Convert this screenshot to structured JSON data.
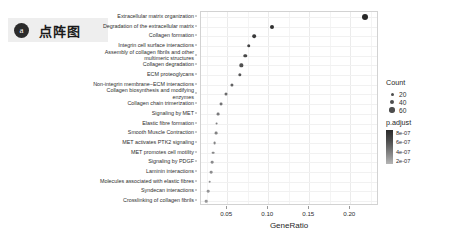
{
  "badge": {
    "letter": "a",
    "title": "点阵图"
  },
  "chart_data": {
    "type": "scatter",
    "title": "",
    "xlabel": "GeneRatio",
    "ylabel": "",
    "xlim": [
      0.018,
      0.235
    ],
    "xticks": [
      0.05,
      0.1,
      0.15,
      0.2
    ],
    "xtick_labels": [
      "0.05",
      "0.10",
      "0.15",
      "0.20"
    ],
    "grid": true,
    "legend_position": "right",
    "categories": [
      "Extracellular matrix organization",
      "Degradation of the extracellular matrix",
      "Collagen formation",
      "Integrin cell surface interactions",
      "Assembly of collagen fibrils and other\nmultimeric structures",
      "Collagen degradation",
      "ECM proteoglycans",
      "Non-integrin membrane−ECM interactions",
      "Collagen biosynthesis and modifying\nenzymes",
      "Collagen chain trimerization",
      "Signaling by MET",
      "Elastic fibre formation",
      "Smooth Muscle Contraction",
      "MET activates PTK2 signaling",
      "MET promotes cell motility",
      "Signaling by PDGF",
      "Laminin interactions",
      "Molecules associated with elastic fibres",
      "Syndecan interactions",
      "Crosslinking of collagen fibrils"
    ],
    "points": [
      {
        "label": "Extracellular matrix organization",
        "gene_ratio": 0.2175,
        "count": 62,
        "p_adjust": 1e-07
      },
      {
        "label": "Degradation of the extracellular matrix",
        "gene_ratio": 0.105,
        "count": 30,
        "p_adjust": 1.6e-07
      },
      {
        "label": "Collagen formation",
        "gene_ratio": 0.083,
        "count": 24,
        "p_adjust": 2.2e-07
      },
      {
        "label": "Integrin cell surface interactions",
        "gene_ratio": 0.076,
        "count": 22,
        "p_adjust": 2.8e-07
      },
      {
        "label": "Assembly of collagen fibrils and other multimeric structures",
        "gene_ratio": 0.072,
        "count": 21,
        "p_adjust": 3.2e-07
      },
      {
        "label": "Collagen degradation",
        "gene_ratio": 0.067,
        "count": 19,
        "p_adjust": 3.8e-07
      },
      {
        "label": "ECM proteoglycans",
        "gene_ratio": 0.0655,
        "count": 19,
        "p_adjust": 4.2e-07
      },
      {
        "label": "Non-integrin membrane−ECM interactions",
        "gene_ratio": 0.056,
        "count": 16,
        "p_adjust": 5e-07
      },
      {
        "label": "Collagen biosynthesis and modifying enzymes",
        "gene_ratio": 0.048,
        "count": 14,
        "p_adjust": 5.6e-07
      },
      {
        "label": "Collagen chain trimerization",
        "gene_ratio": 0.042,
        "count": 12,
        "p_adjust": 6.2e-07
      },
      {
        "label": "Signaling by MET",
        "gene_ratio": 0.0385,
        "count": 11,
        "p_adjust": 6.6e-07
      },
      {
        "label": "Elastic fibre formation",
        "gene_ratio": 0.037,
        "count": 11,
        "p_adjust": 7e-07
      },
      {
        "label": "Smooth Muscle Contraction",
        "gene_ratio": 0.036,
        "count": 10,
        "p_adjust": 7.2e-07
      },
      {
        "label": "MET activates PTK2 signaling",
        "gene_ratio": 0.0345,
        "count": 10,
        "p_adjust": 7.4e-07
      },
      {
        "label": "MET promotes cell motility",
        "gene_ratio": 0.033,
        "count": 9,
        "p_adjust": 7.6e-07
      },
      {
        "label": "Signaling by PDGF",
        "gene_ratio": 0.032,
        "count": 9,
        "p_adjust": 7.8e-07
      },
      {
        "label": "Laminin interactions",
        "gene_ratio": 0.03,
        "count": 9,
        "p_adjust": 8e-07
      },
      {
        "label": "Molecules associated with elastic fibres",
        "gene_ratio": 0.0285,
        "count": 8,
        "p_adjust": 8.2e-07
      },
      {
        "label": "Syndecan interactions",
        "gene_ratio": 0.0265,
        "count": 8,
        "p_adjust": 8.4e-07
      },
      {
        "label": "Crosslinking of collagen fibrils",
        "gene_ratio": 0.024,
        "count": 7,
        "p_adjust": 8.6e-07
      }
    ]
  },
  "legend_count": {
    "title": "Count",
    "items": [
      {
        "label": "20",
        "size": 3.0
      },
      {
        "label": "40",
        "size": 4.2
      },
      {
        "label": "60",
        "size": 5.4
      }
    ]
  },
  "legend_padjust": {
    "title": "p.adjust",
    "labels": [
      "8e-07",
      "6e-07",
      "4e-07",
      "2e-07"
    ],
    "color_high": "#b5b5b5",
    "color_low": "#2b2b2b"
  }
}
